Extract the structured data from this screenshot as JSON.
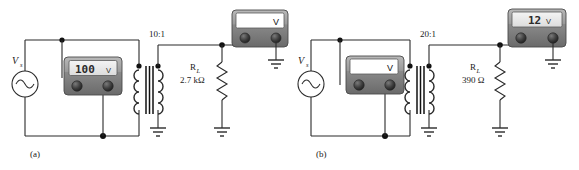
{
  "figure": {
    "type": "circuit-schematic",
    "panels": [
      {
        "id": "a",
        "caption": "(a)",
        "source_label": "V",
        "source_sub": "s",
        "source_symbol": "ac-sine",
        "turns_ratio": "10:1",
        "primary_meter": {
          "display_value": "100",
          "display_unit": "V",
          "faceplate_label": "",
          "type": "digital-lcd",
          "reads": "primary"
        },
        "secondary_meter": {
          "display_value": "",
          "display_unit": "",
          "faceplate_label": "V",
          "type": "blank",
          "reads": "secondary"
        },
        "load": {
          "name": "R",
          "subscript": "L",
          "value": "2.7 kΩ"
        },
        "ground_count": 3
      },
      {
        "id": "b",
        "caption": "(b)",
        "source_label": "V",
        "source_sub": "s",
        "source_symbol": "ac-sine",
        "turns_ratio": "20:1",
        "primary_meter": {
          "display_value": "",
          "display_unit": "",
          "faceplate_label": "V",
          "type": "blank",
          "reads": "primary"
        },
        "secondary_meter": {
          "display_value": "12",
          "display_unit": "V",
          "faceplate_label": "",
          "type": "digital-lcd",
          "reads": "secondary"
        },
        "load": {
          "name": "R",
          "subscript": "L",
          "value": "390 Ω"
        },
        "ground_count": 3
      }
    ],
    "colors": {
      "wire": "#2a2a2a",
      "meter_body": "#8d8d8d",
      "meter_body_dark": "#6e6e6e",
      "meter_screen": "#e9e9e9",
      "background": "#ffffff"
    }
  }
}
